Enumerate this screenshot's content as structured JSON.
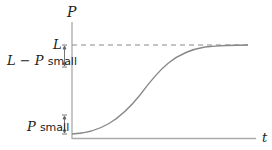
{
  "diagram": {
    "y_axis_label": "P",
    "x_axis_label": "t",
    "asymptote_label": "L",
    "upper_bracket": {
      "var": "L − P",
      "word": "small"
    },
    "lower_bracket": {
      "var": "P",
      "word": "small"
    },
    "colors": {
      "axis": "#aaaaaa",
      "curve": "#888888",
      "dash": "#888888",
      "text": "#222222"
    }
  }
}
